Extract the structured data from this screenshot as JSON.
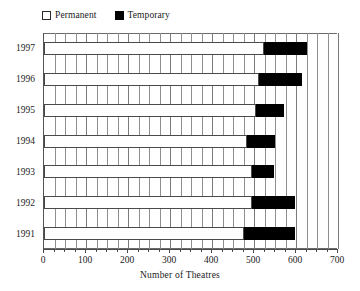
{
  "chart_data": {
    "type": "bar",
    "orientation": "horizontal",
    "stacked": true,
    "title": "",
    "xlabel": "Number of Theatres",
    "ylabel": "",
    "xlim": [
      0,
      700
    ],
    "ylim": null,
    "grid": true,
    "grid_axis": "x",
    "grid_interval": 25,
    "tick_interval": 100,
    "minor_tick_interval": 25,
    "legend_position": "top-left",
    "categories": [
      "1997",
      "1996",
      "1995",
      "1994",
      "1993",
      "1992",
      "1991"
    ],
    "series": [
      {
        "name": "Permanent",
        "color": "#ffffff",
        "values": [
          523,
          513,
          505,
          483,
          495,
          495,
          477
        ]
      },
      {
        "name": "Temporary",
        "color": "#000000",
        "values": [
          104,
          102,
          66,
          66,
          53,
          102,
          120
        ]
      }
    ],
    "totals": [
      627,
      615,
      571,
      549,
      548,
      597,
      597
    ],
    "xtick_labels": [
      "0",
      "100",
      "200",
      "300",
      "400",
      "500",
      "600",
      "700"
    ],
    "xtick_values": [
      0,
      100,
      200,
      300,
      400,
      500,
      600,
      700
    ]
  },
  "legend": {
    "entries": [
      {
        "label": "Permanent",
        "swatch": "permanent-swatch-icon"
      },
      {
        "label": "Temporary",
        "swatch": "temporary-swatch-icon"
      }
    ]
  },
  "axis": {
    "x_title": "Number of Theatres"
  }
}
